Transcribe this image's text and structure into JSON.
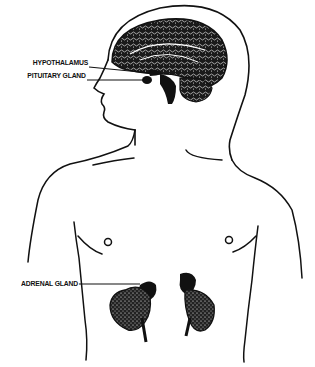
{
  "diagram": {
    "type": "anatomical-illustration",
    "colors": {
      "ink": "#111111",
      "background": "#ffffff"
    },
    "labels": [
      {
        "id": "hypothalamus",
        "text": "HYPOTHALAMUS"
      },
      {
        "id": "pituitary",
        "text": "PITUITARY GLAND"
      },
      {
        "id": "adrenal",
        "text": "ADRENAL GLAND"
      }
    ]
  }
}
